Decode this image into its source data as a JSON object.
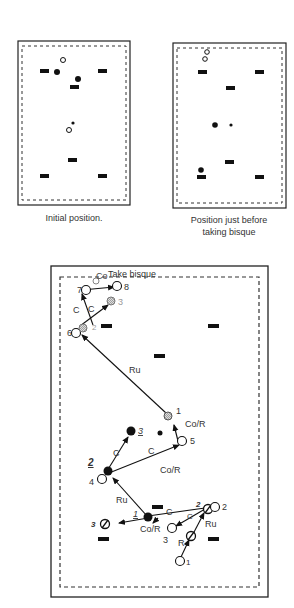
{
  "captions": {
    "initial": "Initial position.",
    "before_bisque_line1": "Position just before",
    "before_bisque_line2": "taking bisque"
  },
  "diagram": {
    "top_label": "Take bisque",
    "co_label": "Co",
    "stroke_labels": {
      "c_7": "C",
      "c_s": "C",
      "ru_top": "Ru",
      "co_r_top": "Co/R",
      "c_3": "C",
      "c_5": "C",
      "co_r_mid": "Co/R",
      "ru_mid": "Ru",
      "c_bottom": "C",
      "c_small": "C",
      "co_r_bottom": "Co/R",
      "ru_right": "Ru",
      "r_bottom": "R"
    },
    "ball_numbers": {
      "n8": "8",
      "n7": "7",
      "n6": "6",
      "n5": "5",
      "n4": "4",
      "n3": "3",
      "n2": "2",
      "n1": "1"
    },
    "turn_numbers": {
      "t1_top": "1",
      "t2_top": "2",
      "t3_top": "3",
      "t1_bottom": "1",
      "t2_left": "2",
      "t3_mid": "3",
      "t2_right": "2",
      "t3_left": "3"
    }
  },
  "colors": {
    "ink": "#111111",
    "hatched": "#888888",
    "frame": "#222222"
  }
}
